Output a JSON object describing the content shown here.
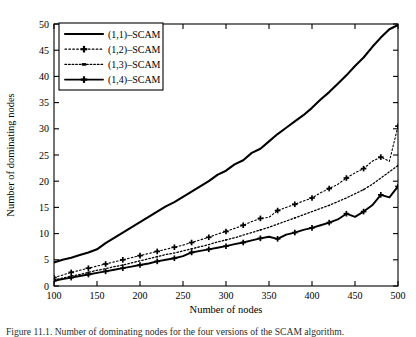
{
  "figure": {
    "caption": "Figure 11.1. Number of dominating nodes for the four versions of the SCAM algorithm."
  },
  "chart_data": {
    "type": "line",
    "title": "",
    "xlabel": "Number of nodes",
    "ylabel": "Number of dominating nodes",
    "xlim": [
      100,
      500
    ],
    "ylim": [
      0,
      50
    ],
    "xticks": [
      100,
      150,
      200,
      250,
      300,
      350,
      400,
      450,
      500
    ],
    "yticks": [
      0,
      5,
      10,
      15,
      20,
      25,
      30,
      35,
      40,
      45,
      50
    ],
    "grid": false,
    "legend_position": "upper-left",
    "x": [
      100,
      110,
      120,
      130,
      140,
      150,
      160,
      170,
      180,
      190,
      200,
      210,
      220,
      230,
      240,
      250,
      260,
      270,
      280,
      290,
      300,
      310,
      320,
      330,
      340,
      350,
      360,
      370,
      380,
      390,
      400,
      410,
      420,
      430,
      440,
      450,
      460,
      470,
      480,
      490,
      500
    ],
    "series": [
      {
        "name": "(1,1)-SCAM",
        "label": "(1,1)–SCAM",
        "style": "solid",
        "marker": "none",
        "color": "#000000",
        "values": [
          4.5,
          5.0,
          5.4,
          5.9,
          6.4,
          7.0,
          8.2,
          9.2,
          10.2,
          11.2,
          12.2,
          13.2,
          14.2,
          15.2,
          16.0,
          17.0,
          18.0,
          19.0,
          20.0,
          21.2,
          22.0,
          23.2,
          24.0,
          25.4,
          26.2,
          27.6,
          29.0,
          30.2,
          31.4,
          32.6,
          34.0,
          35.6,
          37.0,
          38.6,
          40.2,
          42.0,
          43.6,
          45.6,
          47.4,
          49.0,
          49.8
        ]
      },
      {
        "name": "(1,2)-SCAM",
        "label": "(1,2)–SCAM",
        "style": "dotted",
        "marker": "plus",
        "color": "#000000",
        "values": [
          1.6,
          2.1,
          2.6,
          3.0,
          3.4,
          3.8,
          4.2,
          4.6,
          5.0,
          5.4,
          5.8,
          6.2,
          6.6,
          7.0,
          7.4,
          7.8,
          8.3,
          8.8,
          9.3,
          9.9,
          10.4,
          11.0,
          11.6,
          12.3,
          12.9,
          13.1,
          14.4,
          15.0,
          15.6,
          16.2,
          16.8,
          17.8,
          18.6,
          19.4,
          20.6,
          21.6,
          22.4,
          23.8,
          24.6,
          23.8,
          30.5
        ]
      },
      {
        "name": "(1,3)-SCAM",
        "label": "(1,3)–SCAM",
        "style": "dotted",
        "marker": "dot",
        "color": "#000000",
        "values": [
          1.2,
          1.5,
          1.9,
          2.2,
          2.6,
          3.0,
          3.3,
          3.7,
          4.0,
          4.4,
          4.8,
          5.2,
          5.6,
          6.0,
          6.3,
          6.7,
          7.1,
          7.5,
          7.9,
          8.4,
          8.8,
          9.2,
          9.7,
          10.2,
          10.7,
          11.2,
          11.8,
          12.4,
          13.0,
          13.6,
          14.2,
          14.8,
          15.4,
          16.1,
          16.8,
          17.6,
          18.4,
          19.4,
          20.6,
          21.8,
          23.0
        ]
      },
      {
        "name": "(1,4)-SCAM",
        "label": "(1,4)–SCAM",
        "style": "solid",
        "marker": "plus",
        "color": "#000000",
        "values": [
          1.0,
          1.3,
          1.6,
          1.9,
          2.2,
          2.5,
          2.8,
          3.1,
          3.4,
          3.7,
          4.0,
          4.3,
          4.7,
          5.0,
          5.3,
          5.7,
          6.4,
          6.7,
          7.0,
          7.3,
          7.6,
          8.0,
          8.3,
          8.7,
          9.1,
          9.4,
          9.0,
          9.8,
          10.2,
          10.7,
          11.1,
          11.6,
          12.1,
          12.7,
          13.8,
          13.2,
          14.2,
          15.4,
          17.4,
          16.9,
          19.0
        ]
      }
    ]
  }
}
